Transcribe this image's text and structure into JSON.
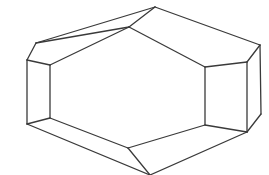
{
  "diagram": {
    "title": "",
    "type": "polyhedron-line-drawing",
    "stroke_color": "#3a3a3a",
    "background": "#ffffff",
    "stroke_width": 1.3,
    "vertices": {
      "top": [
        155,
        7
      ],
      "upper_left": [
        36,
        43
      ],
      "left_top": [
        27,
        60
      ],
      "left_bottom": [
        27,
        124
      ],
      "bottom": [
        150,
        175
      ],
      "right_bottom": [
        261,
        114
      ],
      "right_top": [
        260,
        45
      ],
      "inner_top": [
        129,
        27
      ],
      "inner_left_top": [
        50,
        65
      ],
      "inner_left_bottom": [
        50,
        118
      ],
      "inner_bottom": [
        128,
        148
      ],
      "inner_right_bottom": [
        205,
        125
      ],
      "inner_right_top": [
        205,
        67
      ],
      "face_right_top": [
        247,
        62
      ],
      "face_right_bottom": [
        247,
        132
      ]
    },
    "edges": [
      [
        "upper_left",
        "top"
      ],
      [
        "top",
        "right_top"
      ],
      [
        "right_top",
        "right_bottom"
      ],
      [
        "right_bottom",
        "face_right_bottom"
      ],
      [
        "face_right_bottom",
        "bottom"
      ],
      [
        "bottom",
        "left_bottom"
      ],
      [
        "left_bottom",
        "left_top"
      ],
      [
        "left_top",
        "upper_left"
      ],
      [
        "top",
        "inner_top"
      ],
      [
        "upper_left",
        "inner_top"
      ],
      [
        "inner_top",
        "inner_right_top"
      ],
      [
        "inner_right_top",
        "face_right_top"
      ],
      [
        "face_right_top",
        "right_top"
      ],
      [
        "inner_right_top",
        "inner_right_bottom"
      ],
      [
        "face_right_top",
        "face_right_bottom"
      ],
      [
        "inner_right_bottom",
        "face_right_bottom"
      ],
      [
        "inner_right_bottom",
        "inner_bottom"
      ],
      [
        "inner_bottom",
        "bottom"
      ],
      [
        "inner_bottom",
        "inner_left_bottom"
      ],
      [
        "inner_left_bottom",
        "left_bottom"
      ],
      [
        "inner_left_bottom",
        "inner_left_top"
      ],
      [
        "inner_left_top",
        "left_top"
      ],
      [
        "inner_left_top",
        "inner_top"
      ]
    ]
  }
}
